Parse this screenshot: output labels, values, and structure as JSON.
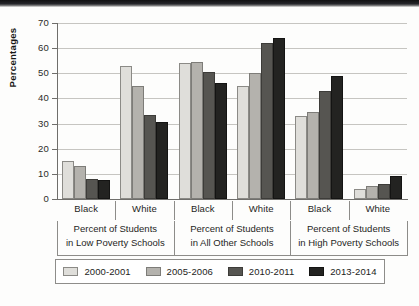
{
  "chart_data": {
    "type": "bar",
    "title": "",
    "xlabel": "",
    "ylabel": "Percentages",
    "ylim": [
      0,
      70
    ],
    "ytick_step": 10,
    "yticks": [
      70,
      60,
      50,
      40,
      30,
      20,
      10,
      0
    ],
    "grid": true,
    "legend_position": "bottom",
    "categories": [
      "Black",
      "White",
      "Black",
      "White",
      "Black",
      "White"
    ],
    "category_groups": [
      {
        "label": "Percent of Students in Low Poverty Schools",
        "label_lines": [
          "Percent of Students",
          "in Low Poverty Schools"
        ],
        "categories": [
          "Black",
          "White"
        ]
      },
      {
        "label": "Percent of Students in All Other Schools",
        "label_lines": [
          "Percent of Students",
          "in All Other Schools"
        ],
        "categories": [
          "Black",
          "White"
        ]
      },
      {
        "label": "Percent of Students in High Poverty Schools",
        "label_lines": [
          "Percent of Students",
          "in High Poverty Schools"
        ],
        "categories": [
          "Black",
          "White"
        ]
      }
    ],
    "series": [
      {
        "name": "2000-2001",
        "color": "#dfdeda",
        "values": [
          15,
          53,
          54,
          45,
          33,
          4
        ]
      },
      {
        "name": "2005-2006",
        "color": "#b4b2ad",
        "values": [
          13,
          45,
          54.5,
          50,
          34.5,
          5
        ]
      },
      {
        "name": "2010-2011",
        "color": "#565551",
        "values": [
          8,
          33.5,
          50.5,
          62,
          43,
          6
        ]
      },
      {
        "name": "2013-2014",
        "color": "#232321",
        "values": [
          7.5,
          30.5,
          46,
          64,
          49,
          9
        ]
      }
    ]
  },
  "legend": {
    "items": [
      {
        "label": "2000-2001"
      },
      {
        "label": "2005-2006"
      },
      {
        "label": "2010-2011"
      },
      {
        "label": "2013-2014"
      }
    ]
  }
}
